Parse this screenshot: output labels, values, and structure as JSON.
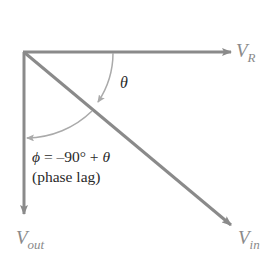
{
  "diagram": {
    "type": "phasor-diagram",
    "colors": {
      "background": "#ffffff",
      "vector": "#8a8a8a",
      "arc": "#aaaaaa",
      "label": "#8a8a8a",
      "text": "#2a2a2a"
    },
    "phasors": [
      {
        "id": "VR",
        "symbol": "V",
        "subscript": "R",
        "direction": "0°"
      },
      {
        "id": "Vin",
        "symbol": "V",
        "subscript": "in",
        "direction": "-θ"
      },
      {
        "id": "Vout",
        "symbol": "V",
        "subscript": "out",
        "direction": "-90°"
      }
    ],
    "angles": [
      {
        "id": "theta",
        "symbol": "θ",
        "between": [
          "VR",
          "Vin"
        ]
      },
      {
        "id": "phi",
        "symbol": "ϕ",
        "between": [
          "Vin",
          "Vout"
        ]
      }
    ],
    "labels": {
      "vr_main": "V",
      "vr_sub": "R",
      "vin_main": "V",
      "vin_sub": "in",
      "vout_main": "V",
      "vout_sub": "out",
      "theta": "θ",
      "phi_symbol": "ϕ",
      "equation": " = –90° + ",
      "equation_theta": "θ",
      "phase_note": "(phase lag)"
    }
  }
}
